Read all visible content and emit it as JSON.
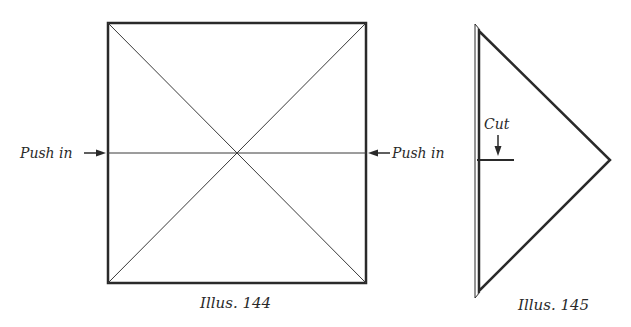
{
  "illus144": {
    "caption": "Illus. 144",
    "left_label": "Push in",
    "right_label": "Push in"
  },
  "illus145": {
    "caption": "Illus. 145",
    "cut_label": "Cut"
  },
  "colors": {
    "line": "#2a2a2a",
    "background": "#ffffff"
  }
}
